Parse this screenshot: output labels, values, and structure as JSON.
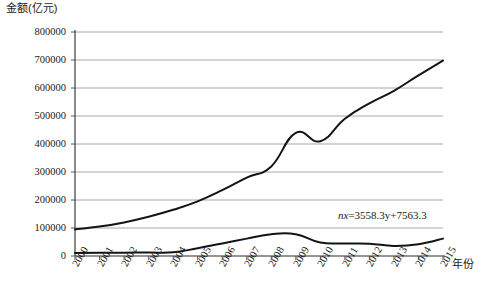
{
  "chart_data": {
    "type": "line",
    "title": "",
    "ylabel": "金额(亿元)",
    "xlabel": "年份",
    "grid": true,
    "legend": "none",
    "ylim": [
      0,
      800000
    ],
    "ytick_step": 100000,
    "yticks": [
      "0",
      "100000",
      "200000",
      "300000",
      "400000",
      "500000",
      "600000",
      "700000",
      "800000"
    ],
    "categories": [
      "2000",
      "2001",
      "2002",
      "2003",
      "2004",
      "2005",
      "2006",
      "2007",
      "2008",
      "2009",
      "2010",
      "2011",
      "2012",
      "2013",
      "2014",
      "2015"
    ],
    "series": [
      {
        "name": "upper",
        "color": "#141414",
        "values": [
          95000,
          105000,
          120000,
          140000,
          165000,
          195000,
          235000,
          280000,
          320000,
          440000,
          410000,
          490000,
          545000,
          590000,
          645000,
          698000
        ]
      },
      {
        "name": "lower",
        "color": "#141414",
        "values": [
          11000,
          11500,
          12000,
          12500,
          13000,
          28000,
          45000,
          62000,
          78000,
          78000,
          48000,
          45000,
          44000,
          36000,
          42000,
          62000
        ]
      }
    ],
    "annotations": [
      {
        "name": "regression-equation",
        "text_parts": {
          "lhs": "nx",
          "eq": "=",
          "rhs": "3558.3y+7563.3"
        },
        "text": "nx=3558.3y+7563.3"
      }
    ]
  }
}
